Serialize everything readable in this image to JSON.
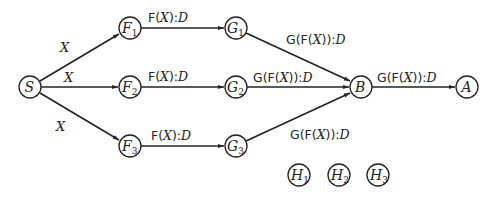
{
  "diagram": {
    "type": "directed-graph",
    "nodes": [
      {
        "id": "S",
        "label": "S",
        "sub": "",
        "x": 30,
        "y": 87
      },
      {
        "id": "F1",
        "label": "F",
        "sub": "1",
        "x": 130,
        "y": 28
      },
      {
        "id": "F2",
        "label": "F",
        "sub": "2",
        "x": 130,
        "y": 87
      },
      {
        "id": "F3",
        "label": "F",
        "sub": "3",
        "x": 130,
        "y": 146
      },
      {
        "id": "G1",
        "label": "G",
        "sub": "1",
        "x": 236,
        "y": 28
      },
      {
        "id": "G2",
        "label": "G",
        "sub": "2",
        "x": 236,
        "y": 87
      },
      {
        "id": "G3",
        "label": "G",
        "sub": "3",
        "x": 236,
        "y": 146
      },
      {
        "id": "B",
        "label": "B",
        "sub": "",
        "x": 361,
        "y": 87
      },
      {
        "id": "A",
        "label": "A",
        "sub": "",
        "x": 467,
        "y": 87
      },
      {
        "id": "H1",
        "label": "H",
        "sub": "1",
        "x": 299,
        "y": 175
      },
      {
        "id": "H2",
        "label": "H",
        "sub": "2",
        "x": 339,
        "y": 175
      },
      {
        "id": "H3",
        "label": "H",
        "sub": "3",
        "x": 378,
        "y": 175
      }
    ],
    "edges": [
      {
        "from": "S",
        "to": "F1",
        "label": "X"
      },
      {
        "from": "S",
        "to": "F2",
        "label": "X"
      },
      {
        "from": "S",
        "to": "F3",
        "label": "X"
      },
      {
        "from": "F1",
        "to": "G1",
        "label": "F(X):D"
      },
      {
        "from": "F2",
        "to": "G2",
        "label": "F(X):D"
      },
      {
        "from": "F3",
        "to": "G3",
        "label": "F(X):D"
      },
      {
        "from": "G1",
        "to": "B",
        "label": "G(F(X)):D"
      },
      {
        "from": "G2",
        "to": "B",
        "label": "G(F(X)):D"
      },
      {
        "from": "G3",
        "to": "B",
        "label": "G(F(X)):D"
      },
      {
        "from": "B",
        "to": "A",
        "label": "G(F(X)):D"
      }
    ],
    "edge_labels": {
      "x_label": "X",
      "f_prefix": "F(",
      "f_var": "X",
      "f_suffix": "):",
      "f_type": "D",
      "g_prefix": "G(F(",
      "g_var": "X",
      "g_suffix": ")):",
      "g_type": "D"
    }
  }
}
